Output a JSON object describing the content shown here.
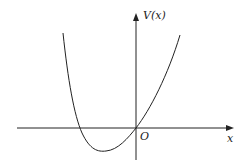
{
  "diagram": {
    "y_axis_label": "V(x)",
    "x_axis_label": "x",
    "origin_label": "O",
    "curve": "potential well: V(x) with minimum left of origin, V(0)=0"
  }
}
